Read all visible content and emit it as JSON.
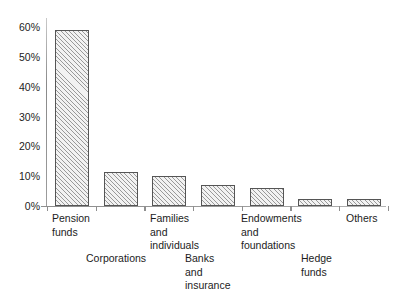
{
  "chart_data": {
    "type": "bar",
    "title": "",
    "subtitle": "",
    "xlabel": "",
    "ylabel": "",
    "ylim": [
      0,
      60
    ],
    "grid": false,
    "legend": null,
    "categories": [
      "Pension funds",
      "Corporations",
      "Families and individuals",
      "Banks and insurance",
      "Endowments and foundations",
      "Hedge funds",
      "Others"
    ],
    "values": [
      59,
      11.5,
      10,
      7,
      6,
      2.5,
      2.5
    ],
    "y_tick_labels": [
      "60%",
      "50%",
      "40%",
      "30%",
      "20%",
      "10%",
      "0%"
    ],
    "y_ticks": [
      60,
      50,
      40,
      30,
      20,
      10,
      0
    ],
    "bar_style": {
      "fill": "#f2f2f2",
      "hatch": "diagonal",
      "edge_color": "#555555"
    },
    "axis_color": "#8f8f8f",
    "background": "#ffffff"
  },
  "axis": {
    "y_labels": [
      {
        "text": "60%",
        "value": 60
      },
      {
        "text": "50%",
        "value": 50
      },
      {
        "text": "40%",
        "value": 40
      },
      {
        "text": "30%",
        "value": 30
      },
      {
        "text": "20%",
        "value": 20
      },
      {
        "text": "10%",
        "value": 10
      },
      {
        "text": "0%",
        "value": 0
      }
    ]
  },
  "category_labels": [
    {
      "text": "Pension\nfunds",
      "row": 1,
      "left": 6
    },
    {
      "text": "Corporations",
      "row": 2,
      "left": 40
    },
    {
      "text": "Families\nand\nindividuals",
      "row": 1,
      "left": 104
    },
    {
      "text": "Banks\nand\ninsurance",
      "row": 2,
      "left": 139
    },
    {
      "text": "Endowments\nand\nfoundations",
      "row": 1,
      "left": 195
    },
    {
      "text": "Hedge\nfunds",
      "row": 2,
      "left": 255
    },
    {
      "text": "Others",
      "row": 1,
      "left": 300
    }
  ]
}
